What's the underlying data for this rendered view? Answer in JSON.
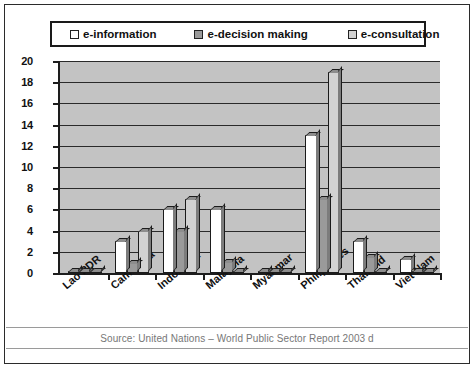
{
  "legend": {
    "items": [
      {
        "label": "e-information",
        "color": "#ffffff"
      },
      {
        "label": "e-decision making",
        "color": "#9a9a9a"
      },
      {
        "label": "e-consultation",
        "color": "#d2d2d2"
      }
    ]
  },
  "source": {
    "text": "Source: United Nations – World Public Sector Report 2003 d"
  },
  "chart_data": {
    "type": "bar",
    "title": "",
    "xlabel": "",
    "ylabel": "",
    "ylim": [
      0,
      20
    ],
    "ytick_step": 2,
    "yticks": [
      "0",
      "2",
      "4",
      "6",
      "8",
      "10",
      "12",
      "14",
      "16",
      "18",
      "20"
    ],
    "grid": true,
    "legend_position": "top",
    "categories": [
      "Lao PDR",
      "Cambodia",
      "Indonesia",
      "Malaysia",
      "Myanmar",
      "Philippines",
      "Thailand",
      "Viet Nam"
    ],
    "series": [
      {
        "name": "e-information",
        "color": "#ffffff",
        "values": [
          0.2,
          3.0,
          6.0,
          6.0,
          0.2,
          13.0,
          3.0,
          1.3
        ]
      },
      {
        "name": "e-decision making",
        "color": "#9a9a9a",
        "values": [
          0.2,
          0.9,
          4.0,
          1.0,
          0.2,
          7.0,
          1.5,
          0.2
        ]
      },
      {
        "name": "e-consultation",
        "color": "#d2d2d2",
        "values": [
          0.2,
          4.0,
          7.0,
          0.15,
          0.2,
          19.0,
          0.2,
          0.1
        ]
      }
    ]
  }
}
